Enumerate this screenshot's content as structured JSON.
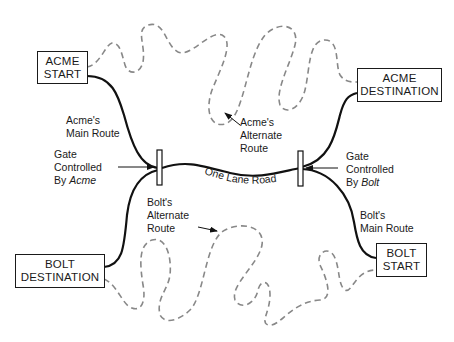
{
  "nodes": {
    "acme_start": {
      "line1": "ACME",
      "line2": "START"
    },
    "acme_destination": {
      "line1": "ACME",
      "line2": "DESTINATION"
    },
    "bolt_destination": {
      "line1": "BOLT",
      "line2": "DESTINATION"
    },
    "bolt_start": {
      "line1": "BOLT",
      "line2": "START"
    }
  },
  "labels": {
    "acme_main_route": {
      "line1": "Acme's",
      "line2": "Main Route"
    },
    "acme_alternate_route": {
      "line1": "Acme's",
      "line2": "Alternate",
      "line3": "Route"
    },
    "bolt_alternate_route": {
      "line1": "Bolt's",
      "line2": "Alternate",
      "line3": "Route"
    },
    "bolt_main_route": {
      "line1": "Bolt's",
      "line2": "Main Route"
    },
    "gate_acme": {
      "line1": "Gate",
      "line2": "Controlled",
      "line3_prefix": "By ",
      "line3_italic": "Acme"
    },
    "gate_bolt": {
      "line1": "Gate",
      "line2": "Controlled",
      "line3_prefix": "By ",
      "line3_italic": "Bolt"
    },
    "one_lane_road": "One Lane Road"
  },
  "colors": {
    "main_route": "#111111",
    "alternate_route": "#888888",
    "text": "#1a1a1a"
  }
}
